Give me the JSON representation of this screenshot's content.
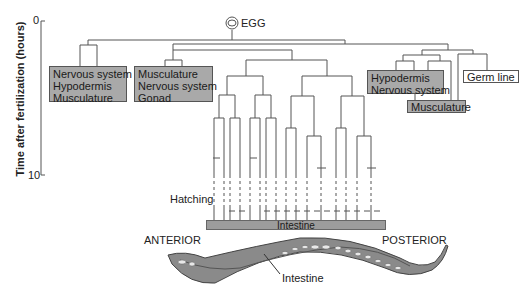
{
  "axis": {
    "title": "Time after fertilization (hours)",
    "tick_start": "0",
    "tick_end": "10"
  },
  "egg": {
    "label": "EGG"
  },
  "boxes": {
    "ab_left": [
      "Nervous system",
      "Hypodermis",
      "Musculature"
    ],
    "ab_right": [
      "Musculature",
      "Nervous system",
      "Gonad"
    ],
    "c_lineage": [
      "Hypodermis",
      "Nervous system"
    ],
    "musculature": [
      "Musculature"
    ],
    "germ_line": [
      "Germ line"
    ]
  },
  "labels": {
    "hatching": "Hatching",
    "intestine_bar": "Intestine",
    "anterior": "ANTERIOR",
    "posterior": "POSTERIOR",
    "worm_intestine": "Intestine"
  },
  "colors": {
    "box_fill": "#a9a9a9",
    "line": "#555555",
    "worm_body": "#8a8a8a"
  }
}
